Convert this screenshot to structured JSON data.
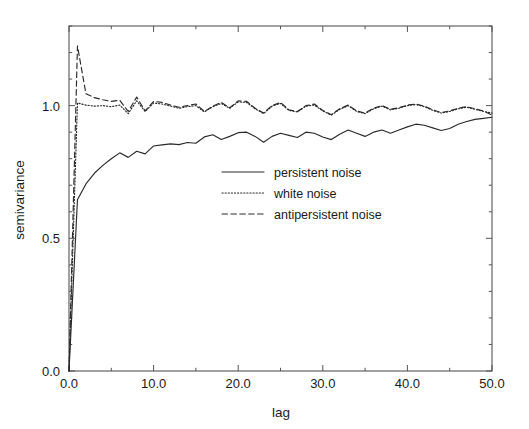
{
  "chart_data": {
    "type": "line",
    "title": "",
    "subtitle": "",
    "xlabel": "lag",
    "ylabel": "semivariance",
    "xlim": [
      0.0,
      50.0
    ],
    "ylim": [
      0.0,
      1.3
    ],
    "xticks": [
      0.0,
      10.0,
      20.0,
      30.0,
      40.0,
      50.0
    ],
    "xtick_labels": [
      "0.0",
      "10.0",
      "20.0",
      "30.0",
      "40.0",
      "50.0"
    ],
    "yticks": [
      0.0,
      0.5,
      1.0
    ],
    "ytick_labels": [
      "0.0",
      "0.5",
      "1.0"
    ],
    "minor_xtick_step": 5.0,
    "minor_ytick_step": 0.1,
    "grid": false,
    "frame": "box",
    "tick_direction": "in",
    "legend_position": "center",
    "legend_entries": [
      {
        "label": "persistent noise",
        "style": "solid"
      },
      {
        "label": "white noise",
        "style": "dotted"
      },
      {
        "label": "antipersistent noise",
        "style": "dashed"
      }
    ],
    "x": [
      0,
      1,
      2,
      3,
      4,
      5,
      6,
      7,
      8,
      9,
      10,
      11,
      12,
      13,
      14,
      15,
      16,
      17,
      18,
      19,
      20,
      21,
      22,
      23,
      24,
      25,
      26,
      27,
      28,
      29,
      30,
      31,
      32,
      33,
      34,
      35,
      36,
      37,
      38,
      39,
      40,
      41,
      42,
      43,
      44,
      45,
      46,
      47,
      48,
      49,
      50
    ],
    "series": [
      {
        "name": "persistent noise",
        "style": "solid",
        "color": "#2a2a2a",
        "values": [
          0.0,
          0.645,
          0.705,
          0.745,
          0.775,
          0.8,
          0.822,
          0.805,
          0.828,
          0.818,
          0.848,
          0.852,
          0.856,
          0.853,
          0.861,
          0.858,
          0.882,
          0.89,
          0.872,
          0.884,
          0.898,
          0.9,
          0.884,
          0.862,
          0.884,
          0.896,
          0.888,
          0.88,
          0.9,
          0.896,
          0.882,
          0.872,
          0.892,
          0.908,
          0.896,
          0.884,
          0.9,
          0.908,
          0.896,
          0.908,
          0.92,
          0.93,
          0.926,
          0.916,
          0.906,
          0.914,
          0.93,
          0.94,
          0.948,
          0.952,
          0.956
        ]
      },
      {
        "name": "white noise",
        "style": "dotted",
        "color": "#2a2a2a",
        "values": [
          0.0,
          1.01,
          1.002,
          0.998,
          1.0,
          0.996,
          1.002,
          0.97,
          1.018,
          0.978,
          1.01,
          1.006,
          0.998,
          0.99,
          0.996,
          1.0,
          0.976,
          0.996,
          1.008,
          0.99,
          1.014,
          1.012,
          0.988,
          0.97,
          0.998,
          1.008,
          0.982,
          0.976,
          0.998,
          1.002,
          0.98,
          0.964,
          0.986,
          1.0,
          0.978,
          0.97,
          0.988,
          0.998,
          0.984,
          0.99,
          1.0,
          1.004,
          0.996,
          0.982,
          0.972,
          0.978,
          0.988,
          0.994,
          0.986,
          0.978,
          0.972
        ]
      },
      {
        "name": "antipersistent noise",
        "style": "dashed",
        "color": "#2a2a2a",
        "values": [
          0.0,
          1.225,
          1.045,
          1.03,
          1.022,
          1.016,
          1.02,
          0.978,
          1.032,
          0.98,
          1.016,
          1.012,
          1.002,
          0.994,
          1.0,
          1.006,
          0.978,
          0.998,
          1.012,
          0.992,
          1.018,
          1.016,
          0.99,
          0.972,
          1.0,
          1.012,
          0.984,
          0.978,
          1.0,
          1.006,
          0.982,
          0.966,
          0.988,
          1.002,
          0.98,
          0.972,
          0.99,
          1.0,
          0.986,
          0.992,
          1.002,
          1.006,
          0.998,
          0.984,
          0.974,
          0.98,
          0.99,
          0.996,
          0.988,
          0.98,
          0.964
        ]
      }
    ]
  },
  "axes": {
    "xlabel": "lag",
    "ylabel": "semivariance"
  }
}
